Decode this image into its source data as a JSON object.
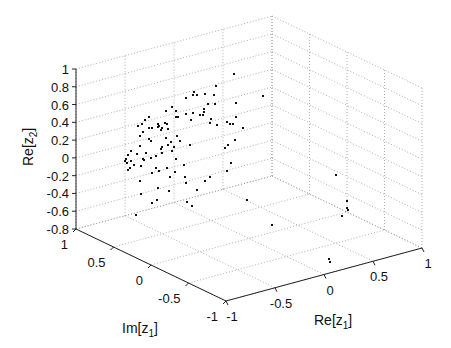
{
  "chart_data": {
    "type": "scatter3d",
    "title": "",
    "xlabel": "Re[z1]",
    "ylabel": "Im[z1]",
    "zlabel": "Re[z2]",
    "xlim": [
      -1,
      1
    ],
    "ylim": [
      -1,
      1
    ],
    "zlim": [
      -0.8,
      1
    ],
    "xticks": [
      "-1",
      "-0.5",
      "0",
      "0.5",
      "1"
    ],
    "yticks": [
      "1",
      "0.5",
      "0",
      "-0.5",
      "-1"
    ],
    "zticks": [
      "1",
      "0.8",
      "0.6",
      "0.4",
      "0.2",
      "0",
      "-0.2",
      "-0.4",
      "-0.6",
      "-0.8"
    ],
    "grid": true,
    "marker": "dot",
    "color": "#111111",
    "points_screen": [
      [
        194,
        92
      ],
      [
        197,
        95
      ],
      [
        193,
        95
      ],
      [
        216,
        86
      ],
      [
        205,
        94
      ],
      [
        214,
        95
      ],
      [
        208,
        104
      ],
      [
        204,
        109
      ],
      [
        215,
        104
      ],
      [
        234,
        74
      ],
      [
        236,
        103
      ],
      [
        186,
        98
      ],
      [
        172,
        107
      ],
      [
        176,
        111
      ],
      [
        165,
        123
      ],
      [
        166,
        111
      ],
      [
        158,
        124
      ],
      [
        152,
        128
      ],
      [
        158,
        127
      ],
      [
        161,
        130
      ],
      [
        162,
        128
      ],
      [
        159,
        126
      ],
      [
        168,
        129
      ],
      [
        167,
        124
      ],
      [
        142,
        124
      ],
      [
        145,
        120
      ],
      [
        149,
        117
      ],
      [
        138,
        126
      ],
      [
        140,
        136
      ],
      [
        143,
        132
      ],
      [
        149,
        128
      ],
      [
        149,
        139
      ],
      [
        151,
        141
      ],
      [
        166,
        138
      ],
      [
        177,
        136
      ],
      [
        171,
        142
      ],
      [
        176,
        117
      ],
      [
        200,
        115
      ],
      [
        204,
        112
      ],
      [
        211,
        119
      ],
      [
        191,
        120
      ],
      [
        186,
        114
      ],
      [
        178,
        117
      ],
      [
        193,
        113
      ],
      [
        172,
        151
      ],
      [
        180,
        141
      ],
      [
        190,
        145
      ],
      [
        203,
        115
      ],
      [
        227,
        122
      ],
      [
        210,
        123
      ],
      [
        217,
        125
      ],
      [
        230,
        124
      ],
      [
        236,
        117
      ],
      [
        233,
        124
      ],
      [
        243,
        128
      ],
      [
        228,
        145
      ],
      [
        235,
        140
      ],
      [
        225,
        148
      ],
      [
        140,
        146
      ],
      [
        137,
        154
      ],
      [
        162,
        147
      ],
      [
        168,
        145
      ],
      [
        174,
        147
      ],
      [
        156,
        156
      ],
      [
        161,
        149
      ],
      [
        162,
        153
      ],
      [
        144,
        160
      ],
      [
        131,
        151
      ],
      [
        128,
        155
      ],
      [
        131,
        161
      ],
      [
        130,
        168
      ],
      [
        134,
        165
      ],
      [
        141,
        166
      ],
      [
        140,
        181
      ],
      [
        156,
        168
      ],
      [
        152,
        173
      ],
      [
        159,
        171
      ],
      [
        167,
        168
      ],
      [
        170,
        177
      ],
      [
        185,
        177
      ],
      [
        186,
        183
      ],
      [
        184,
        165
      ],
      [
        205,
        181
      ],
      [
        210,
        177
      ],
      [
        127,
        163
      ],
      [
        126,
        159
      ],
      [
        158,
        188
      ],
      [
        175,
        172
      ],
      [
        141,
        194
      ],
      [
        157,
        200
      ],
      [
        169,
        191
      ],
      [
        152,
        203
      ],
      [
        187,
        202
      ],
      [
        192,
        206
      ],
      [
        136,
        215
      ],
      [
        197,
        190
      ],
      [
        125,
        161
      ],
      [
        128,
        170
      ],
      [
        263,
        96
      ],
      [
        336,
        175
      ],
      [
        347,
        201
      ],
      [
        348,
        210
      ],
      [
        329,
        259
      ],
      [
        330,
        262
      ],
      [
        342,
        216
      ],
      [
        347,
        208
      ],
      [
        272,
        225
      ],
      [
        247,
        200
      ],
      [
        231,
        163
      ],
      [
        227,
        171
      ],
      [
        143,
        159
      ],
      [
        146,
        153
      ],
      [
        151,
        158
      ],
      [
        176,
        159
      ]
    ]
  },
  "axes": {
    "x_label": "Re[z",
    "x_label_sub": "1",
    "x_label_end": "]",
    "y_label": "Im[z",
    "y_label_sub": "1",
    "y_label_end": "]",
    "z_label": "Re[z",
    "z_label_sub": "2",
    "z_label_end": "]"
  }
}
